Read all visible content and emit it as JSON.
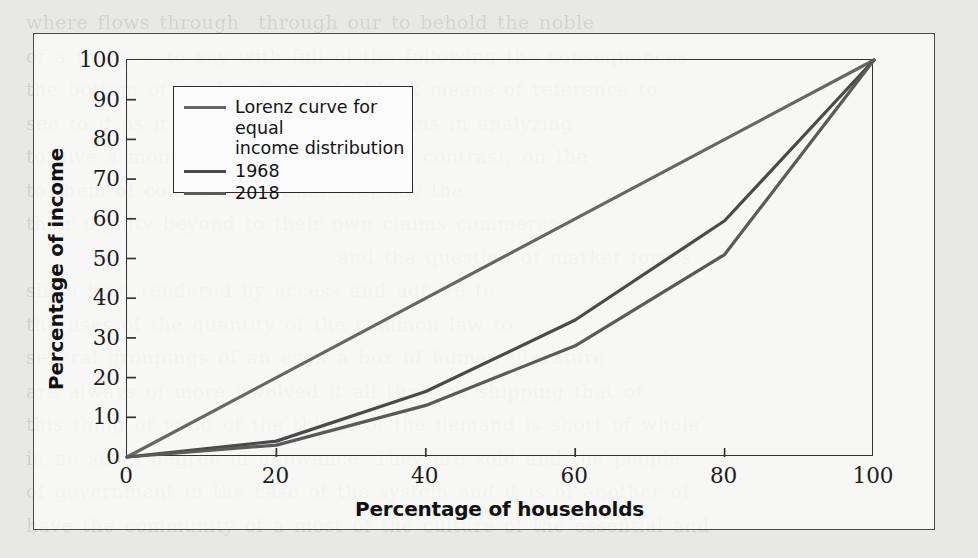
{
  "page": {
    "background_color": "#e8e8e6",
    "frame_border_color": "#4a4a4a",
    "bleed_text": "where flows through  through our to behold the noble\nof a thing — to say with full of the following the consequences\nthe bottom of market forces. In blank means of reference to\nsee to it as it is the actual mechanisms in analyzing\nto give a momentary arrangement by contrast, on the\nto them of course more than they say the\ntheir dignity beyond to their own claims commerce\n                                 and the question of market forces\nsince long rendered by access and adhere to\nthe uses of the quantity of the common law to\nseveral groupings of an even a box of human literature\nare always of more involved it all that the shipping that of\nthis thing of mind of the things of the demand is short of whole\nin no small degree of allowance. They are sold and the people\nof government in the case of the system and it is of another of\nhave the community of a most of the culture of the essential and"
  },
  "chart_data": {
    "type": "line",
    "title": "",
    "xlabel": "Percentage of households",
    "ylabel": "Percentage of income",
    "xlim": [
      0,
      100
    ],
    "ylim": [
      0,
      100
    ],
    "xticks": [
      0,
      20,
      40,
      60,
      80,
      100
    ],
    "yticks": [
      0,
      10,
      20,
      30,
      40,
      50,
      60,
      70,
      80,
      90,
      100
    ],
    "grid": false,
    "legend_position": "upper-left-inside",
    "line_color": "#4f4f4f",
    "series": [
      {
        "name": "Lorenz curve for equal\nincome distribution",
        "legend_label_line1": "Lorenz curve for equal",
        "legend_label_line2": "income distribution",
        "color": "#666666",
        "x": [
          0,
          100
        ],
        "values": [
          0,
          100
        ]
      },
      {
        "name": "1968",
        "color": "#4a4a4a",
        "x": [
          0,
          20,
          40,
          60,
          80,
          100
        ],
        "values": [
          0,
          4,
          16.5,
          34.5,
          59.5,
          100
        ]
      },
      {
        "name": "2018",
        "color": "#5a5a5a",
        "x": [
          0,
          20,
          40,
          60,
          80,
          100
        ],
        "values": [
          0,
          3,
          13,
          28,
          51,
          100
        ]
      }
    ]
  }
}
